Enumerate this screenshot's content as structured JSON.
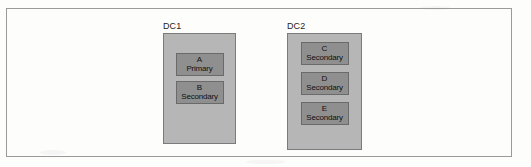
{
  "figure": {
    "frame_color": "#9a9a9a",
    "background_color": "#fdfdfc",
    "datacenter_fill": "#b6b6b6",
    "node_fill": "#8f8f8f",
    "datacenters": [
      {
        "label": "DC1",
        "nodes": [
          {
            "name": "A",
            "role": "Primary"
          },
          {
            "name": "B",
            "role": "Secondary"
          }
        ]
      },
      {
        "label": "DC2",
        "nodes": [
          {
            "name": "C",
            "role": "Secondary"
          },
          {
            "name": "D",
            "role": "Secondary"
          },
          {
            "name": "E",
            "role": "Secondary"
          }
        ]
      }
    ]
  }
}
